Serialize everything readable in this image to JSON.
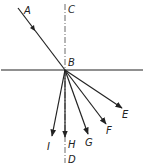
{
  "diagram": {
    "title": "",
    "point_labels": {
      "A": "A",
      "B": "B",
      "C": "C",
      "D": "D",
      "E": "E",
      "F": "F",
      "G": "G",
      "H": "H",
      "I": "I"
    },
    "colors": {
      "line": "#222222",
      "background": "#ffffff"
    },
    "elements": {
      "incident_ray": "A to B",
      "normal": "C to D (dash-dot)",
      "interface": "horizontal line through B",
      "rays_from_B": [
        "E",
        "F",
        "G",
        "H",
        "I"
      ]
    }
  }
}
